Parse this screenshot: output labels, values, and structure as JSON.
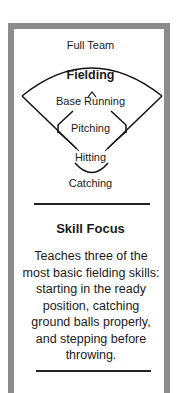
{
  "diagram": {
    "top_label": "Full Team",
    "nodes": [
      "Fielding",
      "Base Running",
      "Pitching",
      "Hitting",
      "Catching"
    ],
    "emphasized": "Fielding"
  },
  "skill_focus": {
    "title": "Skill Focus",
    "body": "Teaches three of the most basic fielding skills: starting in the ready position, catching ground balls properly, and stepping before throwing."
  },
  "colors": {
    "border": "#8c8c8c",
    "text": "#1a1a1a"
  }
}
